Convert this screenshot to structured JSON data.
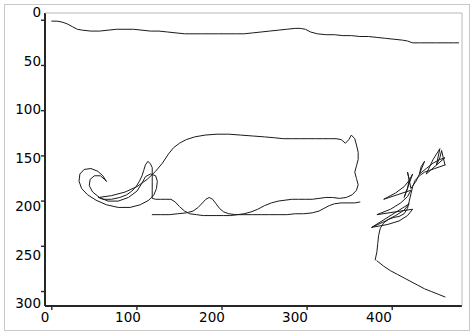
{
  "figure": {
    "title": "",
    "background_color": "#ffffff",
    "border_color": "#c9c9c9",
    "axis_color": "#262626",
    "line_color": "#1a1a1a"
  },
  "axes": {
    "xlabel": "",
    "ylabel": "",
    "x_ticks": [
      "0",
      "100",
      "200",
      "300",
      "400"
    ],
    "y_ticks": [
      "0",
      "50",
      "100",
      "150",
      "200",
      "250",
      "300"
    ],
    "x_range": [
      -8,
      482
    ],
    "y_range": [
      -8,
      316
    ],
    "y_inverted": true,
    "grid": false
  },
  "chart_data": {
    "type": "line",
    "title": "",
    "xlabel": "",
    "ylabel": "",
    "xlim": [
      -8,
      482
    ],
    "ylim": [
      316,
      -8
    ],
    "y_inverted": true,
    "grid": false,
    "legend": null,
    "series": [
      {
        "name": "top-background-edge",
        "color": "#1a1a1a",
        "points": [
          [
            0,
            1
          ],
          [
            6,
            1
          ],
          [
            12,
            2
          ],
          [
            18,
            4
          ],
          [
            24,
            7
          ],
          [
            30,
            10
          ],
          [
            36,
            11
          ],
          [
            46,
            12
          ],
          [
            56,
            12
          ],
          [
            66,
            11
          ],
          [
            76,
            10
          ],
          [
            86,
            10
          ],
          [
            96,
            10
          ],
          [
            106,
            11
          ],
          [
            116,
            12
          ],
          [
            126,
            12
          ],
          [
            136,
            13
          ],
          [
            146,
            14
          ],
          [
            156,
            15
          ],
          [
            166,
            15
          ],
          [
            176,
            15
          ],
          [
            186,
            15
          ],
          [
            196,
            15
          ],
          [
            206,
            15
          ],
          [
            216,
            15
          ],
          [
            226,
            15
          ],
          [
            236,
            14
          ],
          [
            246,
            13
          ],
          [
            256,
            12
          ],
          [
            266,
            11
          ],
          [
            276,
            10
          ],
          [
            286,
            9
          ],
          [
            292,
            9
          ],
          [
            298,
            10
          ],
          [
            304,
            13
          ],
          [
            312,
            15
          ],
          [
            322,
            16
          ],
          [
            332,
            16
          ],
          [
            342,
            17
          ],
          [
            352,
            17
          ],
          [
            362,
            18
          ],
          [
            372,
            18
          ],
          [
            382,
            19
          ],
          [
            392,
            20
          ],
          [
            402,
            21
          ],
          [
            412,
            22
          ],
          [
            418,
            23
          ],
          [
            424,
            25
          ],
          [
            432,
            25
          ],
          [
            442,
            25
          ],
          [
            452,
            25
          ],
          [
            462,
            25
          ],
          [
            472,
            25
          ],
          [
            478,
            25
          ]
        ]
      },
      {
        "name": "cat-body-outline",
        "color": "#1a1a1a",
        "points": [
          [
            64,
            178
          ],
          [
            60,
            172
          ],
          [
            54,
            167
          ],
          [
            46,
            164
          ],
          [
            38,
            165
          ],
          [
            33,
            170
          ],
          [
            32,
            178
          ],
          [
            35,
            186
          ],
          [
            42,
            193
          ],
          [
            52,
            199
          ],
          [
            64,
            204
          ],
          [
            78,
            207
          ],
          [
            92,
            207
          ],
          [
            104,
            204
          ],
          [
            114,
            199
          ],
          [
            120,
            193
          ],
          [
            123,
            186
          ],
          [
            124,
            178
          ],
          [
            122,
            172
          ],
          [
            116,
            170
          ],
          [
            110,
            173
          ],
          [
            106,
            180
          ],
          [
            100,
            189
          ],
          [
            90,
            196
          ],
          [
            78,
            200
          ],
          [
            66,
            200
          ],
          [
            56,
            196
          ],
          [
            48,
            190
          ],
          [
            44,
            183
          ],
          [
            45,
            176
          ],
          [
            50,
            172
          ],
          [
            57,
            172
          ],
          [
            62,
            176
          ],
          [
            64,
            178
          ]
        ]
      },
      {
        "name": "cat-back-and-tail",
        "color": "#1a1a1a",
        "points": [
          [
            55,
            196
          ],
          [
            70,
            194
          ],
          [
            86,
            190
          ],
          [
            100,
            184
          ],
          [
            112,
            176
          ],
          [
            122,
            167
          ],
          [
            130,
            158
          ],
          [
            137,
            148
          ],
          [
            143,
            141
          ],
          [
            150,
            136
          ],
          [
            158,
            132
          ],
          [
            168,
            129
          ],
          [
            180,
            127
          ],
          [
            194,
            126
          ],
          [
            208,
            126
          ],
          [
            222,
            127
          ],
          [
            236,
            128
          ],
          [
            250,
            129
          ],
          [
            262,
            130
          ],
          [
            272,
            131
          ],
          [
            282,
            131
          ],
          [
            292,
            131
          ],
          [
            300,
            131
          ],
          [
            310,
            131
          ],
          [
            318,
            131
          ],
          [
            326,
            131
          ],
          [
            334,
            131
          ],
          [
            340,
            132
          ],
          [
            345,
            136
          ],
          [
            349,
            132
          ],
          [
            352,
            127
          ],
          [
            356,
            131
          ],
          [
            358,
            138
          ],
          [
            360,
            146
          ],
          [
            360,
            154
          ],
          [
            358,
            161
          ],
          [
            356,
            168
          ],
          [
            358,
            175
          ],
          [
            360,
            182
          ],
          [
            358,
            188
          ],
          [
            353,
            193
          ],
          [
            346,
            196
          ],
          [
            338,
            197
          ],
          [
            330,
            196
          ],
          [
            322,
            196
          ],
          [
            314,
            197
          ],
          [
            306,
            198
          ],
          [
            298,
            198
          ],
          [
            290,
            198
          ],
          [
            282,
            198
          ],
          [
            274,
            199
          ],
          [
            266,
            200
          ],
          [
            258,
            202
          ],
          [
            250,
            205
          ],
          [
            242,
            209
          ],
          [
            234,
            212
          ],
          [
            226,
            214
          ],
          [
            218,
            215
          ],
          [
            210,
            216
          ],
          [
            202,
            216
          ],
          [
            194,
            216
          ],
          [
            186,
            216
          ],
          [
            178,
            216
          ],
          [
            170,
            215
          ],
          [
            162,
            214
          ],
          [
            156,
            211
          ],
          [
            150,
            206
          ],
          [
            145,
            201
          ],
          [
            140,
            198
          ],
          [
            134,
            198
          ],
          [
            128,
            198
          ],
          [
            122,
            198
          ],
          [
            118,
            197
          ],
          [
            118,
            188
          ],
          [
            118,
            178
          ],
          [
            118,
            170
          ],
          [
            118,
            163
          ],
          [
            116,
            159
          ],
          [
            113,
            156
          ],
          [
            110,
            160
          ],
          [
            108,
            166
          ],
          [
            106,
            172
          ],
          [
            103,
            178
          ],
          [
            99,
            184
          ],
          [
            94,
            189
          ],
          [
            88,
            193
          ],
          [
            80,
            196
          ],
          [
            70,
            198
          ],
          [
            60,
            198
          ],
          [
            55,
            196
          ]
        ]
      },
      {
        "name": "cat-lower-body-edge",
        "color": "#1a1a1a",
        "points": [
          [
            118,
            215
          ],
          [
            128,
            215
          ],
          [
            138,
            215
          ],
          [
            148,
            214
          ],
          [
            158,
            213
          ],
          [
            166,
            211
          ],
          [
            172,
            207
          ],
          [
            177,
            202
          ],
          [
            181,
            198
          ],
          [
            185,
            196
          ],
          [
            189,
            198
          ],
          [
            193,
            203
          ],
          [
            197,
            208
          ],
          [
            202,
            212
          ],
          [
            208,
            214
          ],
          [
            216,
            215
          ],
          [
            226,
            215
          ],
          [
            236,
            215
          ],
          [
            246,
            215
          ],
          [
            256,
            215
          ],
          [
            266,
            215
          ],
          [
            276,
            215
          ],
          [
            286,
            214
          ],
          [
            296,
            214
          ],
          [
            306,
            213
          ],
          [
            314,
            211
          ],
          [
            320,
            208
          ],
          [
            326,
            205
          ],
          [
            332,
            203
          ],
          [
            340,
            202
          ],
          [
            348,
            202
          ],
          [
            356,
            202
          ],
          [
            362,
            201
          ]
        ]
      },
      {
        "name": "hand-outline-right",
        "color": "#1a1a1a",
        "points": [
          [
            380,
            265
          ],
          [
            382,
            256
          ],
          [
            383,
            247
          ],
          [
            384,
            238
          ],
          [
            386,
            230
          ],
          [
            390,
            224
          ],
          [
            396,
            220
          ],
          [
            402,
            218
          ],
          [
            408,
            217
          ],
          [
            414,
            214
          ],
          [
            418,
            208
          ],
          [
            420,
            200
          ],
          [
            422,
            192
          ],
          [
            424,
            184
          ],
          [
            427,
            177
          ],
          [
            432,
            172
          ],
          [
            438,
            168
          ],
          [
            444,
            166
          ],
          [
            450,
            164
          ],
          [
            456,
            162
          ],
          [
            462,
            160
          ]
        ]
      },
      {
        "name": "hand-lower-contour",
        "color": "#1a1a1a",
        "points": [
          [
            382,
            266
          ],
          [
            390,
            272
          ],
          [
            398,
            277
          ],
          [
            406,
            281
          ],
          [
            414,
            285
          ],
          [
            422,
            289
          ],
          [
            430,
            293
          ],
          [
            438,
            297
          ],
          [
            446,
            300
          ],
          [
            454,
            303
          ],
          [
            462,
            306
          ]
        ]
      },
      {
        "name": "finger-strokes",
        "color": "#1a1a1a",
        "points": [
          [
            376,
            229
          ],
          [
            392,
            222
          ],
          [
            404,
            216
          ],
          [
            414,
            210
          ],
          [
            420,
            203
          ],
          [
            376,
            229
          ],
          [
            394,
            226
          ],
          [
            408,
            222
          ],
          [
            418,
            216
          ],
          [
            424,
            209
          ],
          [
            382,
            215
          ],
          [
            398,
            209
          ],
          [
            410,
            202
          ],
          [
            418,
            195
          ],
          [
            422,
            188
          ],
          [
            390,
            198
          ],
          [
            404,
            191
          ],
          [
            414,
            184
          ],
          [
            420,
            177
          ],
          [
            424,
            170
          ],
          [
            414,
            196
          ],
          [
            418,
            186
          ],
          [
            420,
            176
          ],
          [
            418,
            168
          ],
          [
            422,
            186
          ],
          [
            428,
            178
          ],
          [
            432,
            170
          ],
          [
            434,
            162
          ],
          [
            438,
            156
          ],
          [
            432,
            170
          ],
          [
            440,
            164
          ],
          [
            448,
            158
          ],
          [
            456,
            154
          ],
          [
            462,
            152
          ],
          [
            440,
            170
          ],
          [
            444,
            162
          ],
          [
            448,
            154
          ],
          [
            452,
            148
          ],
          [
            456,
            142
          ],
          [
            452,
            160
          ],
          [
            456,
            152
          ],
          [
            458,
            144
          ],
          [
            460,
            152
          ],
          [
            462,
            160
          ]
        ]
      }
    ]
  }
}
